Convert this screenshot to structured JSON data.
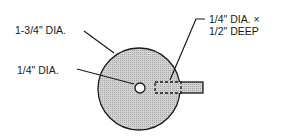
{
  "labels": {
    "outer_diameter": "1-3/4\" DIA.",
    "center_hole": "1/4\" DIA.",
    "side_hole_line1": "1/4\" DIA. ×",
    "side_hole_line2": "1/2\" DEEP"
  },
  "colors": {
    "line": "#1a1a1a",
    "fill": "#c8c8c8",
    "background": "#ffffff"
  }
}
